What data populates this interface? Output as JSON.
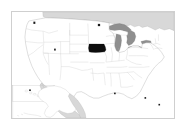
{
  "figure": {
    "type": "locator-map",
    "frame": {
      "border_color": "#cfcfcf",
      "background_color": "#ffffff",
      "x": 11,
      "y": 11,
      "width": 164,
      "height": 108
    }
  },
  "colors": {
    "highlight": "#0d0d0d",
    "state_fill": "#ffffff",
    "state_border": "#bdbdbd",
    "country_border": "#9a9a9a",
    "neighbor_fill": "#d8d8d8",
    "water_fill": "#8f8f8f",
    "water_border": "#6e6e6e",
    "marker": "#1a1a1a",
    "inset_border": "#c4c4c4",
    "page_background": "#ffffff"
  },
  "map": {
    "projection_note": "Albers-like conic projection of the contiguous United States",
    "highlighted_region": {
      "name": "Iowa",
      "abbreviation": "IA",
      "fill": "#0d0d0d"
    },
    "neighbors": [
      {
        "name": "Canada",
        "fill": "#d8d8d8"
      },
      {
        "name": "Mexico",
        "fill": "#d8d8d8"
      }
    ],
    "water_bodies": [
      {
        "name": "Lake Superior"
      },
      {
        "name": "Lake Michigan"
      },
      {
        "name": "Lake Huron"
      },
      {
        "name": "Lake Erie"
      },
      {
        "name": "Lake Ontario"
      }
    ],
    "insets": [
      {
        "name": "Alaska",
        "position": "lower-left"
      },
      {
        "name": "Hawaii",
        "position": "lower-left"
      }
    ],
    "markers": [
      {
        "name": "marker-northwest",
        "x": 69,
        "y": 33
      },
      {
        "name": "marker-north-central",
        "x": 268,
        "y": 40
      },
      {
        "name": "marker-west",
        "x": 133,
        "y": 117
      },
      {
        "name": "marker-south-central",
        "x": 56,
        "y": 244
      },
      {
        "name": "marker-southeast",
        "x": 318,
        "y": 254
      },
      {
        "name": "marker-east",
        "x": 412,
        "y": 268
      }
    ]
  },
  "accessibility": {
    "alt_text": "Map of the United States with Iowa highlighted in black."
  }
}
